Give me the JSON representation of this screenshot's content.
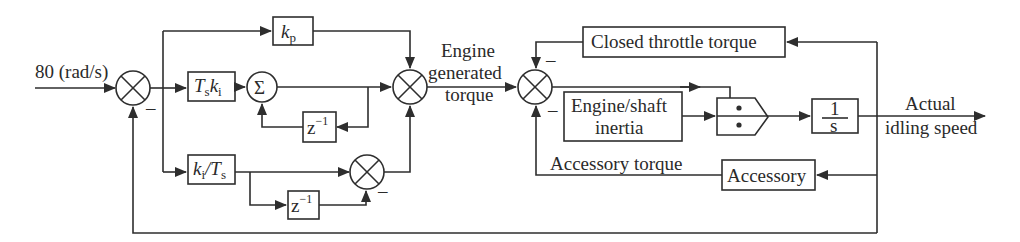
{
  "diagram": {
    "input": {
      "label": "80 (rad/s)"
    },
    "blocks": {
      "kp": {
        "main": "k",
        "sub": "p"
      },
      "tski": {
        "a": "T",
        "a_sub": "s",
        "b": "k",
        "b_sub": "i"
      },
      "sigma": {
        "label": "Σ"
      },
      "z_top": {
        "base": "z",
        "sup": "−1"
      },
      "kits": {
        "a": "k",
        "a_sub": "i",
        "slash": "/",
        "b": "T",
        "b_sub": "s"
      },
      "z_bottom": {
        "base": "z",
        "sup": "−1"
      },
      "closed_throttle": {
        "label": "Closed throttle torque"
      },
      "engine_shaft": {
        "line1": "Engine/shaft",
        "line2": "inertia"
      },
      "divide": {
        "label": "÷"
      },
      "integrator": {
        "num": "1",
        "den": "s"
      },
      "accessory": {
        "label": "Accessory"
      }
    },
    "signals": {
      "engine_torque": {
        "line1": "Engine",
        "line2": "generated",
        "line3": "torque"
      },
      "accessory_torque": {
        "label": "Accessory torque"
      },
      "output": {
        "line1": "Actual",
        "line2": "idling speed"
      }
    },
    "signs": {
      "minus": "–"
    }
  }
}
